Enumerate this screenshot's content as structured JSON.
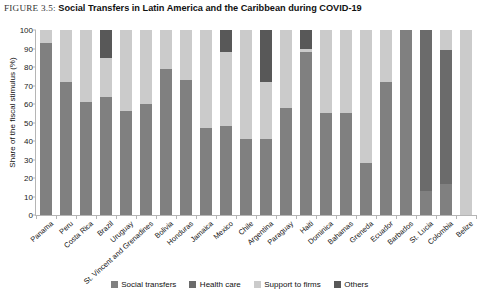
{
  "figure": {
    "label": "FIGURE 3.5:",
    "caption": "Social Transfers in Latin America and the Caribbean during COVID-19"
  },
  "legend": {
    "items": [
      {
        "label": "Social transfers",
        "color": "#808080",
        "icon": "legend-swatch-icon"
      },
      {
        "label": "Health care",
        "color": "#6b6b6b",
        "icon": "legend-swatch-icon"
      },
      {
        "label": "Support to firms",
        "color": "#cbcbcb",
        "icon": "legend-swatch-icon"
      },
      {
        "label": "Others",
        "color": "#585858",
        "icon": "legend-swatch-icon"
      }
    ]
  },
  "chart_data": {
    "type": "bar",
    "stacked": true,
    "title": "Social Transfers in Latin America and the Caribbean during COVID-19",
    "xlabel": "",
    "ylabel": "Share of the fiscal stimulus (%)",
    "ylim": [
      0,
      100
    ],
    "yticks": [
      0,
      10,
      20,
      30,
      40,
      50,
      60,
      70,
      80,
      90,
      100
    ],
    "grid": false,
    "legend_position": "bottom",
    "categories": [
      "Panama",
      "Peru",
      "Costa Rica",
      "Brazil",
      "Uruguay",
      "St. Vincent and Grenadines",
      "Bolivia",
      "Honduras",
      "Jamaica",
      "Mexico",
      "Chile",
      "Argentina",
      "Paraguay",
      "Haiti",
      "Dominica",
      "Bahamas",
      "Greneda",
      "Ecuador",
      "Barbados",
      "St. Lucia",
      "Colombia",
      "Belize"
    ],
    "series": [
      {
        "name": "Social transfers",
        "color": "#808080",
        "values": [
          93,
          72,
          61,
          64,
          56,
          60,
          79,
          73,
          47,
          48,
          41,
          41,
          58,
          88,
          55,
          55,
          28,
          72,
          100,
          13,
          17,
          0
        ]
      },
      {
        "name": "Health care",
        "color": "#6b6b6b",
        "values": [
          0,
          0,
          0,
          0,
          0,
          0,
          0,
          0,
          0,
          0,
          0,
          0,
          0,
          0,
          0,
          0,
          0,
          0,
          0,
          87,
          72,
          0
        ]
      },
      {
        "name": "Support to firms",
        "color": "#cbcbcb",
        "values": [
          7,
          28,
          39,
          21,
          44,
          40,
          21,
          27,
          53,
          40,
          59,
          31,
          42,
          2,
          45,
          45,
          72,
          28,
          0,
          0,
          11,
          100
        ]
      },
      {
        "name": "Others",
        "color": "#585858",
        "values": [
          0,
          0,
          0,
          15,
          0,
          0,
          0,
          0,
          0,
          12,
          0,
          28,
          0,
          10,
          0,
          0,
          0,
          0,
          0,
          0,
          0,
          0
        ]
      }
    ]
  }
}
